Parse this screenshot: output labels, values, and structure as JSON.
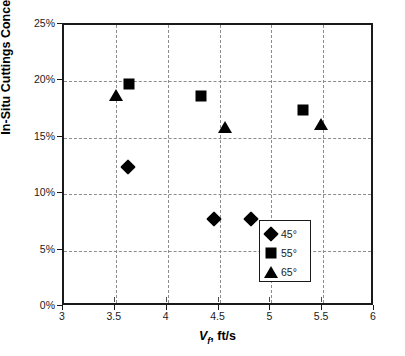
{
  "chart_data": {
    "type": "scatter",
    "title": "",
    "xlabel": "V_f, ft/s",
    "xlabel_parts": {
      "symbol": "V",
      "subscript": "f",
      "rest": ", ft/s"
    },
    "ylabel": "In-Situ Cuttings Concentration",
    "xlim": [
      3,
      6
    ],
    "ylim": [
      0,
      25
    ],
    "xticks": [
      "3",
      "3.5",
      "4",
      "4.5",
      "5",
      "5.5",
      "6"
    ],
    "xtick_values": [
      3,
      3.5,
      4,
      4.5,
      5,
      5.5,
      6
    ],
    "yticks": [
      "0%",
      "5%",
      "10%",
      "15%",
      "20%",
      "25%"
    ],
    "ytick_values": [
      0,
      5,
      10,
      15,
      20,
      25
    ],
    "grid": true,
    "grid_style": "dashed",
    "legend_position": "bottom-right",
    "marker_color": "#000000",
    "series": [
      {
        "name": "45°",
        "marker": "diamond",
        "points": [
          {
            "x": 3.62,
            "y": 12.4
          },
          {
            "x": 4.45,
            "y": 7.8
          },
          {
            "x": 4.8,
            "y": 7.8
          }
        ]
      },
      {
        "name": "55°",
        "marker": "square",
        "points": [
          {
            "x": 3.63,
            "y": 19.8
          },
          {
            "x": 4.32,
            "y": 18.7
          },
          {
            "x": 5.31,
            "y": 17.5
          }
        ]
      },
      {
        "name": "65°",
        "marker": "triangle",
        "points": [
          {
            "x": 3.5,
            "y": 18.8
          },
          {
            "x": 4.55,
            "y": 16.0
          },
          {
            "x": 5.48,
            "y": 16.2
          }
        ]
      }
    ],
    "legend": [
      {
        "label": "45°",
        "marker": "diamond"
      },
      {
        "label": "55°",
        "marker": "square"
      },
      {
        "label": "65°",
        "marker": "triangle"
      }
    ]
  }
}
